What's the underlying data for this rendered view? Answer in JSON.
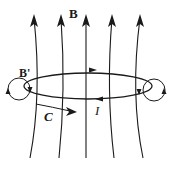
{
  "diagram": {
    "type": "magnetic field of a current loop",
    "labels": {
      "field": "B",
      "induced_field": "B'",
      "contour": "C",
      "current": "I"
    },
    "field_lines_count": 5,
    "colors": {
      "stroke": "#1a1a1a",
      "background": "#ffffff"
    }
  }
}
